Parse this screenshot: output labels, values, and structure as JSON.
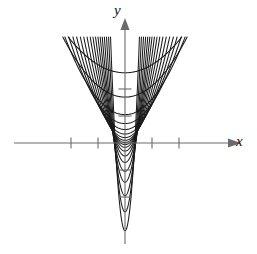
{
  "figure": {
    "title": "",
    "axis_labels": {
      "x": "y",
      "y": "y"
    },
    "label_x": "x",
    "label_y": "y",
    "background_color": "#ffffff",
    "curve_color": "#1a1a1a",
    "axis_color": "#6b6b6b"
  },
  "chart_data": {
    "type": "line",
    "title": "",
    "subtitle": "",
    "xlabel": "x",
    "ylabel": "y",
    "grid": false,
    "legend": false,
    "legend_position": "none",
    "xlim": [
      -4.2,
      4.2
    ],
    "ylim": [
      -3.6,
      3.6
    ],
    "x_ticks": [
      -2,
      -1,
      1,
      2
    ],
    "x_tick_labels": [
      "",
      "",
      "",
      ""
    ],
    "y_ticks": [
      -2,
      -1,
      1,
      2
    ],
    "y_tick_labels": [
      "",
      "",
      "",
      ""
    ],
    "x_axis_arrow": true,
    "y_axis_arrow": true,
    "origin_px": [
      125,
      143
    ],
    "px_per_unit_x": 27,
    "px_per_unit_y": 27,
    "curve_family": "y = a*x^2 + c",
    "series": [
      {
        "name": "c=2.60",
        "a": 0.3,
        "c": 2.6
      },
      {
        "name": "c=1.70",
        "a": 0.42,
        "c": 1.7
      },
      {
        "name": "c=1.05",
        "a": 0.58,
        "c": 1.05
      },
      {
        "name": "c=0.72",
        "a": 0.74,
        "c": 0.72
      },
      {
        "name": "c=0.50",
        "a": 0.92,
        "c": 0.5
      },
      {
        "name": "c=0.33",
        "a": 1.12,
        "c": 0.33
      },
      {
        "name": "c=0.20",
        "a": 1.36,
        "c": 0.2
      },
      {
        "name": "c=0.10",
        "a": 1.64,
        "c": 0.1
      },
      {
        "name": "c=0.02",
        "a": 1.98,
        "c": 0.02
      },
      {
        "name": "c=-0.06",
        "a": 2.4,
        "c": -0.06
      },
      {
        "name": "c=-0.16",
        "a": 2.9,
        "c": -0.16
      },
      {
        "name": "c=-0.30",
        "a": 3.55,
        "c": -0.3
      },
      {
        "name": "c=-0.48",
        "a": 4.4,
        "c": -0.48
      },
      {
        "name": "c=-0.72",
        "a": 5.5,
        "c": -0.72
      },
      {
        "name": "c=-1.05",
        "a": 7.0,
        "c": -1.05
      },
      {
        "name": "c=-1.45",
        "a": 9.2,
        "c": -1.45
      },
      {
        "name": "c=-1.95",
        "a": 12.5,
        "c": -1.95
      },
      {
        "name": "c=-2.55",
        "a": 17.5,
        "c": -2.55
      },
      {
        "name": "c=-3.25",
        "a": 25.0,
        "c": -3.25
      }
    ]
  }
}
